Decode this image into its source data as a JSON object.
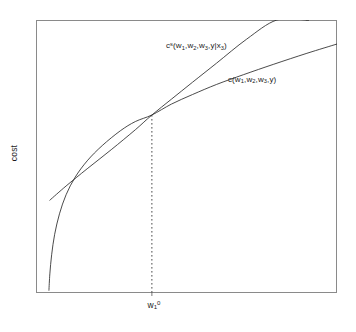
{
  "figure": {
    "background_color": "#ffffff",
    "frame_color": "#8a8a8a",
    "curve_color": "#2b2b2b"
  },
  "axes": {
    "ylabel": "cost",
    "xlabel": "",
    "xtick_label_html": "w<sub>1</sub><sup>0</sup>",
    "xtick_label_text": "w1^0"
  },
  "labels": {
    "short_run_html": "c<sup>s</sup>(w<sub>1</sub>,w<sub>2</sub>,w<sub>3</sub>,y|x<sub>3</sub>)",
    "short_run_text": "c^s(w1,w2,w3,y|x3)",
    "long_run_html": "c(w<sub>1</sub>,w<sub>2</sub>,w<sub>3</sub>,y)",
    "long_run_text": "c(w1,w2,w3,y)"
  },
  "chart_data": {
    "type": "line",
    "title": "",
    "xlabel": "",
    "ylabel": "cost",
    "grid": false,
    "legend": "inline-annotations",
    "xlim": [
      0,
      1
    ],
    "ylim": [
      0,
      1
    ],
    "xticks": [
      0.385
    ],
    "xticklabels": [
      "w1^0"
    ],
    "yticks": [],
    "yticklabels": [],
    "annotations": [
      {
        "name": "short-run-cost-label",
        "text": "c^s(w1,w2,w3,y|x3)",
        "x": 0.43,
        "y": 0.92
      },
      {
        "name": "long-run-cost-label",
        "text": "c(w1,w2,w3,y)",
        "x": 0.64,
        "y": 0.8
      }
    ],
    "tangency_point": {
      "x": 0.385,
      "y": 0.652
    },
    "series": [
      {
        "name": "c(w1,w2,w3,y)",
        "description": "long-run cost function, concave in input price w1",
        "style": "solid",
        "x": [
          0.043,
          0.046,
          0.052,
          0.062,
          0.078,
          0.1,
          0.13,
          0.17,
          0.22,
          0.28,
          0.33,
          0.385,
          0.45,
          0.52,
          0.6,
          0.69,
          0.79,
          0.9,
          1.0
        ],
        "y": [
          0.01,
          0.07,
          0.14,
          0.215,
          0.29,
          0.36,
          0.424,
          0.484,
          0.54,
          0.594,
          0.628,
          0.652,
          0.692,
          0.727,
          0.764,
          0.8,
          0.838,
          0.878,
          0.912
        ]
      },
      {
        "name": "c^s(w1,w2,w3,y|x3)",
        "description": "short-run cost function, linear-ish and tangent from above at w1^0",
        "style": "solid",
        "x": [
          0.046,
          0.1,
          0.17,
          0.25,
          0.33,
          0.385,
          0.45,
          0.52,
          0.6,
          0.7,
          0.8,
          0.9,
          0.898
        ],
        "y": [
          0.34,
          0.392,
          0.455,
          0.525,
          0.598,
          0.652,
          0.71,
          0.772,
          0.842,
          0.93,
          1.0,
          1.0,
          1.0
        ]
      },
      {
        "name": "tangency-dropline",
        "description": "vertical dashed line from tangency point down to x-axis at w1^0",
        "style": "dashed",
        "x": [
          0.385,
          0.385
        ],
        "y": [
          0.652,
          0.0
        ]
      }
    ]
  }
}
